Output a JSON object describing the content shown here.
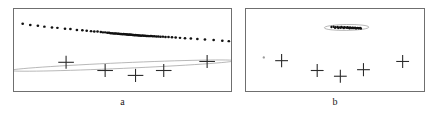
{
  "figure": {
    "width": 429,
    "height": 117,
    "background": "#ffffff",
    "frame_color": "#6f6f6f",
    "marker_color": "#2b2b2b",
    "point_color": "#111111",
    "ellipse_color": "#9a9a9a"
  },
  "panels": [
    {
      "id": "a",
      "label": "a",
      "frame": {
        "x": 13,
        "y": 8,
        "width": 219,
        "height": 84
      },
      "label_box": {
        "x": 13,
        "y": 96,
        "width": 219,
        "height": 14
      }
    },
    {
      "id": "b",
      "label": "b",
      "frame": {
        "x": 245,
        "y": 8,
        "width": 180,
        "height": 84
      },
      "label_box": {
        "x": 245,
        "y": 96,
        "width": 180,
        "height": 14
      }
    }
  ],
  "chart_data": [
    {
      "type": "scatter",
      "title": "a",
      "xlabel": "",
      "ylabel": "",
      "xlim": [
        0,
        100
      ],
      "ylim": [
        0,
        100
      ],
      "grid": false,
      "legend": "none",
      "annotations": [
        "thin elongated confidence ellipse around the diagonal point cloud"
      ],
      "series": [
        {
          "name": "data-cloud",
          "marker": "dot",
          "color": "#111111",
          "points": [
            [
              4.0,
              82.0
            ],
            [
              7.5,
              80.5
            ],
            [
              11.0,
              79.5
            ],
            [
              14.0,
              78.5
            ],
            [
              17.5,
              77.5
            ],
            [
              20.0,
              77.0
            ],
            [
              23.5,
              76.0
            ],
            [
              26.0,
              75.5
            ],
            [
              29.0,
              74.5
            ],
            [
              31.5,
              74.0
            ],
            [
              33.5,
              73.5
            ],
            [
              35.5,
              73.0
            ],
            [
              37.0,
              72.5
            ],
            [
              38.5,
              72.5
            ],
            [
              40.0,
              72.0
            ],
            [
              41.0,
              71.5
            ],
            [
              42.0,
              71.5
            ],
            [
              43.0,
              71.0
            ],
            [
              43.8,
              71.0
            ],
            [
              44.5,
              70.5
            ],
            [
              45.2,
              70.5
            ],
            [
              45.9,
              70.0
            ],
            [
              46.5,
              70.2
            ],
            [
              47.1,
              70.0
            ],
            [
              47.8,
              69.8
            ],
            [
              48.3,
              69.9
            ],
            [
              48.9,
              69.5
            ],
            [
              49.4,
              69.6
            ],
            [
              50.0,
              69.3
            ],
            [
              50.5,
              69.4
            ],
            [
              51.0,
              69.1
            ],
            [
              51.5,
              69.2
            ],
            [
              52.0,
              68.9
            ],
            [
              52.4,
              69.0
            ],
            [
              52.9,
              68.7
            ],
            [
              53.3,
              68.8
            ],
            [
              53.8,
              68.5
            ],
            [
              54.2,
              68.6
            ],
            [
              54.7,
              68.3
            ],
            [
              55.1,
              68.4
            ],
            [
              55.6,
              68.1
            ],
            [
              56.0,
              68.2
            ],
            [
              56.5,
              67.9
            ],
            [
              57.0,
              68.0
            ],
            [
              57.5,
              67.7
            ],
            [
              58.0,
              67.8
            ],
            [
              58.6,
              67.5
            ],
            [
              59.2,
              67.6
            ],
            [
              59.8,
              67.3
            ],
            [
              60.4,
              67.4
            ],
            [
              61.0,
              67.1
            ],
            [
              61.7,
              67.2
            ],
            [
              62.4,
              66.9
            ],
            [
              63.1,
              67.0
            ],
            [
              63.9,
              66.7
            ],
            [
              64.7,
              66.8
            ],
            [
              65.6,
              66.4
            ],
            [
              66.5,
              66.5
            ],
            [
              67.5,
              66.2
            ],
            [
              68.6,
              66.3
            ],
            [
              69.8,
              65.9
            ],
            [
              71.2,
              65.8
            ],
            [
              72.8,
              65.5
            ],
            [
              74.5,
              65.2
            ],
            [
              76.5,
              64.8
            ],
            [
              78.8,
              64.4
            ],
            [
              81.5,
              63.9
            ],
            [
              84.5,
              63.4
            ],
            [
              88.0,
              62.8
            ],
            [
              92.0,
              62.1
            ],
            [
              96.0,
              61.4
            ],
            [
              99.0,
              60.8
            ]
          ]
        },
        {
          "name": "plus-markers",
          "marker": "plus",
          "color": "#2b2b2b",
          "points": [
            [
              24.0,
              35.0
            ],
            [
              42.0,
              25.0
            ],
            [
              56.0,
              19.0
            ],
            [
              69.0,
              25.0
            ],
            [
              89.0,
              36.0
            ]
          ]
        }
      ]
    },
    {
      "type": "scatter",
      "title": "b",
      "xlabel": "",
      "ylabel": "",
      "xlim": [
        0,
        100
      ],
      "ylim": [
        0,
        100
      ],
      "grid": false,
      "legend": "none",
      "annotations": [
        "small compact confidence ellipse around the tight point cluster"
      ],
      "series": [
        {
          "name": "data-cloud",
          "marker": "dot",
          "color": "#111111",
          "points": [
            [
              48.0,
              78.0
            ],
            [
              49.2,
              78.4
            ],
            [
              50.4,
              77.8
            ],
            [
              51.5,
              78.2
            ],
            [
              52.6,
              77.6
            ],
            [
              53.6,
              78.0
            ],
            [
              54.5,
              77.4
            ],
            [
              55.4,
              77.9
            ],
            [
              56.2,
              77.3
            ],
            [
              57.0,
              77.7
            ],
            [
              57.8,
              77.1
            ],
            [
              58.5,
              77.5
            ],
            [
              59.2,
              76.9
            ],
            [
              59.9,
              77.3
            ],
            [
              60.6,
              76.8
            ],
            [
              61.3,
              77.2
            ],
            [
              62.0,
              76.6
            ],
            [
              62.7,
              77.0
            ],
            [
              63.4,
              76.5
            ],
            [
              64.1,
              76.9
            ],
            [
              50.0,
              77.2
            ],
            [
              51.8,
              76.9
            ],
            [
              53.2,
              77.1
            ],
            [
              55.0,
              76.7
            ],
            [
              56.8,
              77.0
            ],
            [
              58.2,
              76.5
            ],
            [
              60.0,
              76.8
            ],
            [
              61.6,
              76.4
            ],
            [
              63.0,
              76.7
            ],
            [
              64.6,
              76.3
            ]
          ]
        },
        {
          "name": "plus-markers",
          "marker": "plus",
          "color": "#2b2b2b",
          "points": [
            [
              20.0,
              37.0
            ],
            [
              40.0,
              25.0
            ],
            [
              53.0,
              18.0
            ],
            [
              66.0,
              26.0
            ],
            [
              88.0,
              36.0
            ]
          ]
        },
        {
          "name": "stray-point",
          "marker": "dot",
          "color": "#9a9a9a",
          "points": [
            [
              10.0,
              41.0
            ]
          ]
        }
      ]
    }
  ]
}
